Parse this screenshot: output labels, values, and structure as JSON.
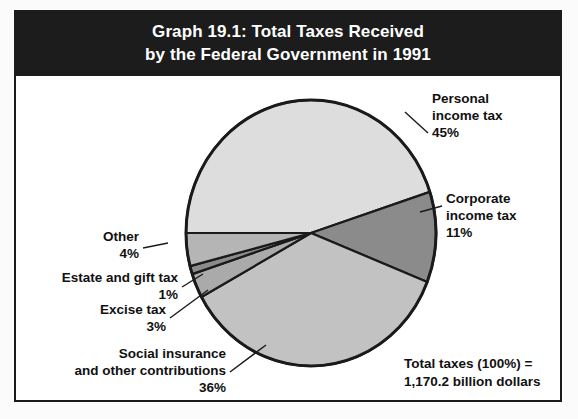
{
  "figure": {
    "title_lines": [
      "Graph 19.1: Total Taxes Received",
      "by the Federal Government in 1991"
    ],
    "total_note_lines": [
      "Total taxes (100%) =",
      "1,170.2 billion dollars"
    ]
  },
  "labels": {
    "personal": {
      "line1": "Personal",
      "line2": "income tax",
      "value": "45%"
    },
    "corporate": {
      "line1": "Corporate",
      "line2": "income tax",
      "value": "11%"
    },
    "other": {
      "line1": "Other",
      "value": "4%"
    },
    "estate": {
      "line1": "Estate and gift tax",
      "value": "1%"
    },
    "excise": {
      "line1": "Excise tax",
      "value": "3%"
    },
    "social": {
      "line1": "Social insurance",
      "line2": "and other contributions",
      "value": "36%"
    }
  },
  "colors": {
    "title_band": "#1c1c1c",
    "title_text": "#ffffff",
    "outline": "#1a1a1a",
    "personal": "#dddddd",
    "corporate": "#8b8b8b",
    "social": "#c2c2c2",
    "excise": "#aaaaaa",
    "estate": "#8b8b8b",
    "other": "#b5b5b5",
    "background": "#ffffff"
  },
  "chart_data": {
    "type": "pie",
    "title": "Graph 19.1: Total Taxes Received by the Federal Government in 1991",
    "total_label": "Total taxes (100%) = 1,170.2 billion dollars",
    "total_value": 1170.2,
    "total_units": "billion dollars",
    "unit": "percent",
    "categories": [
      "Personal income tax",
      "Corporate income tax",
      "Social insurance and other contributions",
      "Excise tax",
      "Estate and gift tax",
      "Other"
    ],
    "values": [
      45,
      11,
      36,
      3,
      1,
      4
    ],
    "legend": "labels with leader lines",
    "grid": false,
    "slices": [
      {
        "name": "Personal income tax",
        "value": 45,
        "color": "#dddddd",
        "start_deg": 180,
        "end_deg": 342
      },
      {
        "name": "Corporate income tax",
        "value": 11,
        "color": "#8b8b8b",
        "start_deg": 342,
        "end_deg": 401.6
      },
      {
        "name": "Social insurance and other contributions",
        "value": 36,
        "color": "#c2c2c2",
        "start_deg": 401.6,
        "end_deg": 531.2
      },
      {
        "name": "Excise tax",
        "value": 3,
        "color": "#aaaaaa",
        "start_deg": 531.2,
        "end_deg": 542
      },
      {
        "name": "Estate and gift tax",
        "value": 1,
        "color": "#8b8b8b",
        "start_deg": 542,
        "end_deg": 545.6
      },
      {
        "name": "Other",
        "value": 4,
        "color": "#b5b5b5",
        "start_deg": 545.6,
        "end_deg": 560
      }
    ]
  }
}
